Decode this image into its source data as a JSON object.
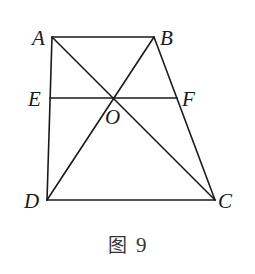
{
  "figure": {
    "caption_char": "图",
    "caption_number": "9",
    "colors": {
      "line": "#1a1a1a",
      "label": "#1a1a1a",
      "background": "#ffffff"
    },
    "points": {
      "A": {
        "x": 52,
        "y": 37,
        "label": "A"
      },
      "B": {
        "x": 154,
        "y": 37,
        "label": "B"
      },
      "C": {
        "x": 215,
        "y": 200,
        "label": "C"
      },
      "D": {
        "x": 47,
        "y": 200,
        "label": "D"
      },
      "E": {
        "x": 50,
        "y": 98,
        "label": "E"
      },
      "F": {
        "x": 177,
        "y": 98,
        "label": "F"
      },
      "O": {
        "x": 115,
        "y": 98,
        "label": "O"
      }
    },
    "segments": [
      {
        "name": "AB",
        "from": "A",
        "to": "B"
      },
      {
        "name": "BC",
        "from": "B",
        "to": "C"
      },
      {
        "name": "CD",
        "from": "C",
        "to": "D"
      },
      {
        "name": "DA",
        "from": "D",
        "to": "A"
      },
      {
        "name": "AC",
        "from": "A",
        "to": "C"
      },
      {
        "name": "BD",
        "from": "B",
        "to": "D"
      },
      {
        "name": "EF",
        "from": "E",
        "to": "F"
      }
    ]
  }
}
